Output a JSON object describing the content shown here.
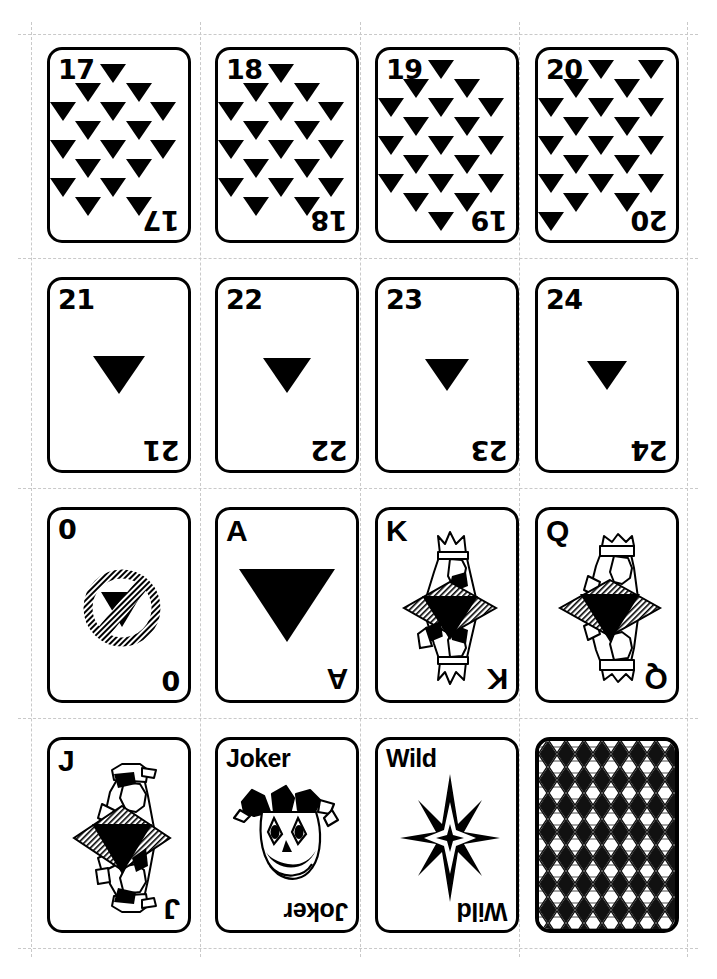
{
  "page": {
    "sheet_background": "#ffffff",
    "ink_color": "#000000",
    "cutline_color": "#c9c9c9",
    "columns": 4,
    "rows": 4
  },
  "cards": [
    {
      "id": "card-17",
      "index_label": "17",
      "kind": "pip",
      "pip_count": 17,
      "pip_shape": "down-triangle",
      "row": 0,
      "col": 0
    },
    {
      "id": "card-18",
      "index_label": "18",
      "kind": "pip",
      "pip_count": 18,
      "pip_shape": "down-triangle",
      "row": 0,
      "col": 1
    },
    {
      "id": "card-19",
      "index_label": "19",
      "kind": "pip",
      "pip_count": 19,
      "pip_shape": "down-triangle",
      "row": 0,
      "col": 2
    },
    {
      "id": "card-20",
      "index_label": "20",
      "kind": "pip",
      "pip_count": 20,
      "pip_shape": "down-triangle",
      "row": 0,
      "col": 3
    },
    {
      "id": "card-21",
      "index_label": "21",
      "kind": "single-pip",
      "pip_shape": "down-triangle",
      "pip_size": "medium",
      "row": 1,
      "col": 0
    },
    {
      "id": "card-22",
      "index_label": "22",
      "kind": "single-pip",
      "pip_shape": "down-triangle",
      "pip_size": "medium-small",
      "row": 1,
      "col": 1
    },
    {
      "id": "card-23",
      "index_label": "23",
      "kind": "single-pip",
      "pip_shape": "down-triangle",
      "pip_size": "small",
      "row": 1,
      "col": 2
    },
    {
      "id": "card-24",
      "index_label": "24",
      "kind": "single-pip",
      "pip_shape": "down-triangle",
      "pip_size": "extra-small",
      "row": 1,
      "col": 3
    },
    {
      "id": "card-0",
      "index_label": "0",
      "kind": "special",
      "art": "no-symbol-over-triangle",
      "row": 2,
      "col": 0
    },
    {
      "id": "card-ace",
      "index_label": "A",
      "kind": "ace",
      "pip_shape": "down-triangle",
      "pip_size": "large",
      "row": 2,
      "col": 1
    },
    {
      "id": "card-king",
      "index_label": "K",
      "kind": "court",
      "art": "king-figure",
      "row": 2,
      "col": 2
    },
    {
      "id": "card-queen",
      "index_label": "Q",
      "kind": "court",
      "art": "queen-figure",
      "row": 2,
      "col": 3
    },
    {
      "id": "card-jack",
      "index_label": "J",
      "kind": "court",
      "art": "jack-figure",
      "row": 3,
      "col": 0
    },
    {
      "id": "card-joker",
      "index_label": "Joker",
      "kind": "joker",
      "art": "jester-face",
      "row": 3,
      "col": 1
    },
    {
      "id": "card-wild",
      "index_label": "Wild",
      "kind": "wild",
      "art": "eight-point-star",
      "row": 3,
      "col": 2
    },
    {
      "id": "card-back",
      "index_label": "",
      "kind": "back",
      "art": "argyle-lattice-pattern",
      "row": 3,
      "col": 3
    }
  ]
}
